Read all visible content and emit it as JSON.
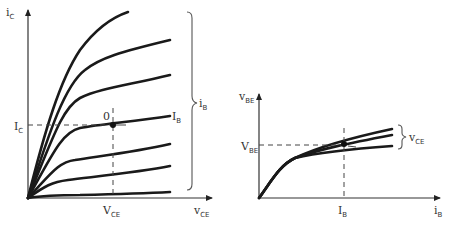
{
  "left_plot": {
    "y_axis_label": "i",
    "y_axis_sub": "C",
    "x_axis_label": "v",
    "x_axis_sub": "CE",
    "ic_tick_label": "I",
    "ic_tick_sub": "C",
    "vce_tick_label": "V",
    "vce_tick_sub": "CE",
    "q_point_label": "0",
    "ib_curve_label": "I",
    "ib_curve_sub": "B",
    "brace_label": "i",
    "brace_sub": "B"
  },
  "right_plot": {
    "y_axis_label": "v",
    "y_axis_sub": "BE",
    "x_axis_label": "i",
    "x_axis_sub": "B",
    "vbe_tick_label": "V",
    "vbe_tick_sub": "BE",
    "ib_tick_label": "I",
    "ib_tick_sub": "B",
    "brace_label": "v",
    "brace_sub": "CE"
  }
}
